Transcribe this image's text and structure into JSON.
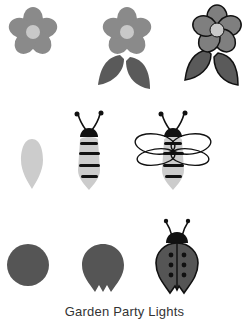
{
  "caption": "Garden Party Lights",
  "colors": {
    "petal": "#8a8a8a",
    "petal_outlined": "#7f7f7f",
    "flower_center": "#c8c8c8",
    "leaf": "#5a5a5a",
    "outline": "#111111",
    "bee_body": "#cccccc",
    "bee_stripe": "#111111",
    "ladybug_body": "#555555"
  },
  "rows": [
    {
      "name": "flower",
      "steps": [
        "flower-petals",
        "flower-with-leaves",
        "flower-outlined"
      ]
    },
    {
      "name": "bee",
      "steps": [
        "bee-body-shape",
        "bee-striped",
        "bee-with-wings"
      ]
    },
    {
      "name": "ladybug",
      "steps": [
        "ladybug-circle",
        "ladybug-shell",
        "ladybug-finished"
      ]
    }
  ]
}
